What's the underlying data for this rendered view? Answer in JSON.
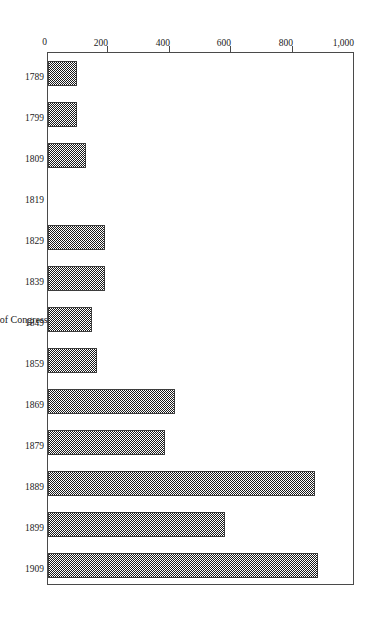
{
  "chart_data": {
    "type": "bar",
    "orientation": "horizontal-rotated",
    "title": "",
    "xlabel": "Start of Congress",
    "ylabel": "",
    "categories": [
      "1789",
      "1799",
      "1809",
      "1819",
      "1829",
      "1839",
      "1849",
      "1859",
      "1869",
      "1879",
      "1889",
      "1899",
      "1909"
    ],
    "values": [
      95,
      95,
      125,
      0,
      185,
      185,
      145,
      160,
      415,
      380,
      870,
      575,
      880
    ],
    "ylim": [
      0,
      1000
    ],
    "yticks": [
      0,
      200,
      400,
      600,
      800,
      1000
    ],
    "ytick_labels": [
      "0",
      "200",
      "400",
      "600",
      "800",
      "1,000"
    ],
    "grid": false,
    "legend": false,
    "bar_fill": "#8d8d8d",
    "bar_edge": "#3d3d3d",
    "frame_color": "#4a4a4a",
    "background": "#ffffff"
  },
  "axis": {
    "category_title": "Start of Congress"
  }
}
